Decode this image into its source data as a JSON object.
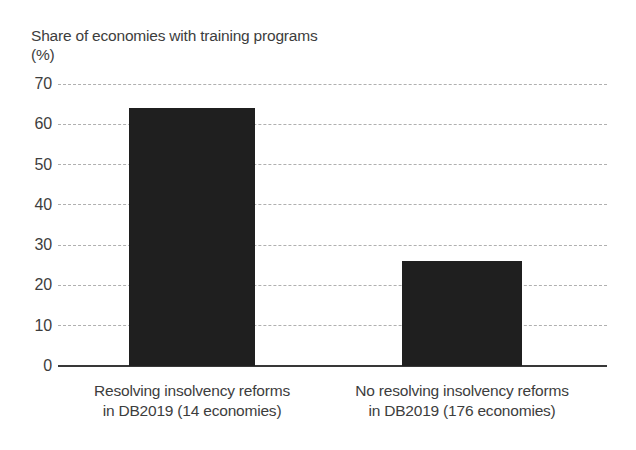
{
  "figure": {
    "title": "Share of economies with training programs",
    "unit_label": "(%)"
  },
  "chart_data": {
    "type": "bar",
    "title": "Share of economies with training programs",
    "ylabel": "(%)",
    "categories": [
      "Resolving insolvency reforms in DB2019 (14 economies)",
      "No resolving insolvency reforms in DB2019 (176 economies)"
    ],
    "categories_lines": [
      [
        "Resolving insolvency reforms",
        "in DB2019 (14 economies)"
      ],
      [
        "No resolving insolvency reforms",
        "in DB2019 (176 economies)"
      ]
    ],
    "values": [
      64,
      26
    ],
    "ylim": [
      0,
      70
    ],
    "yticks": [
      0,
      10,
      20,
      30,
      40,
      50,
      60,
      70
    ],
    "grid": "horizontal-dashed",
    "legend": "none",
    "bar_color": "#1f1f1f",
    "text_color": "#3d3d3d",
    "grid_color": "#b0b0b0",
    "axis_color": "#383838",
    "background": "#ffffff"
  }
}
